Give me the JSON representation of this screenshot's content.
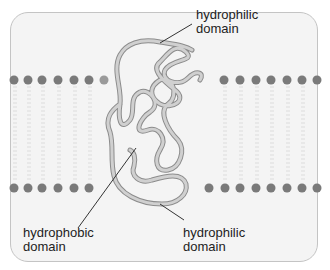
{
  "diagram": {
    "labels": {
      "top_hydrophilic": {
        "line1": "hydrophilic",
        "line2": "domain"
      },
      "hydrophobic": {
        "line1": "hydrophobic",
        "line2": "domain"
      },
      "bottom_hydrophilic": {
        "line1": "hydrophilic",
        "line2": "domain"
      }
    },
    "colors": {
      "frame_fill": "#f4f4f4",
      "frame_border": "#c4c4c4",
      "lipid_head": "#7a7a7a",
      "lipid_tail": "#dcdcdc",
      "protein_strand": "#b9b9b9",
      "protein_outline": "#8c8c8c",
      "leader_line": "#333333"
    },
    "membrane": {
      "top_leaflet_y": 80,
      "bottom_leaflet_y": 188,
      "top_left_heads_x": [
        14,
        28,
        42,
        58,
        74,
        89,
        104
      ],
      "top_right_heads_x": [
        224,
        240,
        256,
        271,
        287,
        302,
        317
      ],
      "bottom_left_heads_x": [
        14,
        28,
        42,
        58,
        74,
        89
      ],
      "bottom_right_heads_x": [
        209,
        225,
        240,
        256,
        271,
        287,
        302,
        317
      ]
    }
  }
}
